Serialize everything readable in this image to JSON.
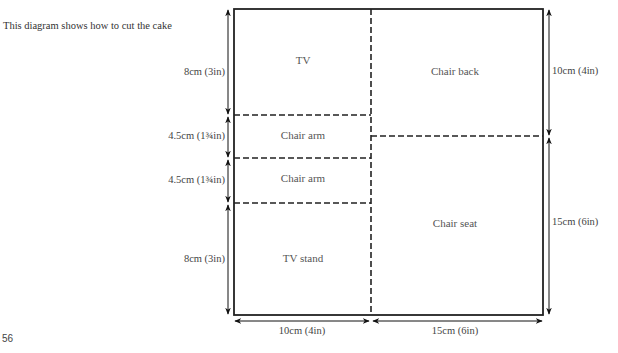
{
  "caption": "This diagram shows how to cut the cake",
  "page_number": "56",
  "pieces": {
    "tv": "TV",
    "chair_arm_1": "Chair arm",
    "chair_arm_2": "Chair arm",
    "tv_stand": "TV stand",
    "chair_back": "Chair back",
    "chair_seat": "Chair seat"
  },
  "dimensions": {
    "left_tv": "8cm (3in)",
    "left_arm_1": "4.5cm (1¾in)",
    "left_arm_2": "4.5cm (1¾in)",
    "left_stand": "8cm (3in)",
    "right_back": "10cm (4in)",
    "right_seat": "15cm (6in)",
    "bottom_left": "10cm (4in)",
    "bottom_right": "15cm (6in)"
  }
}
